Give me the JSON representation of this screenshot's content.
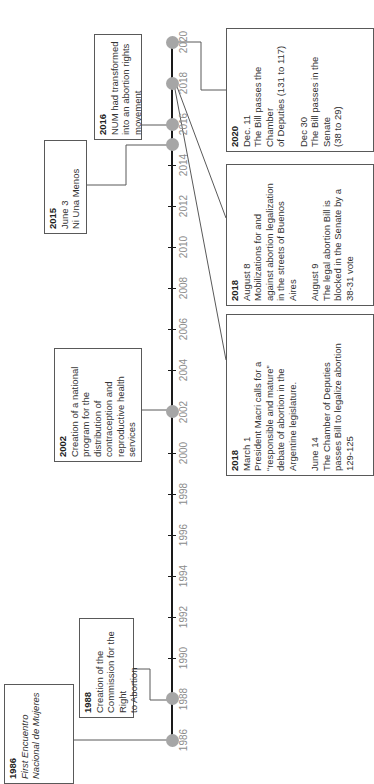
{
  "timeline": {
    "orientation": "rotated-90-ccw",
    "axis_color": "#1a1a1a",
    "dot_color": "#a6a6a6",
    "year_label_color": "#8c8c8c",
    "year_labels": [
      "1986",
      "1988",
      "1990",
      "1992",
      "1994",
      "1996",
      "1998",
      "2000",
      "2002",
      "2004",
      "2006",
      "2008",
      "2010",
      "2012",
      "2014",
      "2016",
      "2018",
      "2020"
    ],
    "markers": [
      "1986",
      "1988",
      "2002",
      "2015",
      "2016",
      "2018",
      "2020"
    ]
  },
  "events": [
    {
      "id": "e1986",
      "year": "1986",
      "lines": [
        {
          "text": "First Encuentro",
          "italic": true
        },
        {
          "text": "Nacional de Mujeres",
          "italic": true
        }
      ]
    },
    {
      "id": "e1988",
      "year": "1988",
      "lines": [
        {
          "text": "Creation of the"
        },
        {
          "text": "Commission for the Right"
        },
        {
          "text": "to Abortion"
        }
      ]
    },
    {
      "id": "e2002",
      "year": "2002",
      "lines": [
        {
          "text": "Creation of a national"
        },
        {
          "text": "program for the"
        },
        {
          "text": "distribution of"
        },
        {
          "text": "contraception and"
        },
        {
          "text": "reproductive health"
        },
        {
          "text": "services"
        }
      ]
    },
    {
      "id": "e2015",
      "year": "2015",
      "lines": [
        {
          "text": "June 3"
        },
        {
          "text": "Ni Una Menos"
        }
      ]
    },
    {
      "id": "e2016",
      "year": "2016",
      "lines": [
        {
          "text": "NUM had transformed"
        },
        {
          "text": "into an abortion rights"
        },
        {
          "text": "movement"
        }
      ]
    },
    {
      "id": "e2018a",
      "year": "2018",
      "lines": [
        {
          "text": "March 1"
        },
        {
          "text": "President Macri calls for a"
        },
        {
          "text": "“responsible and mature”"
        },
        {
          "text": "debate of abortion in the"
        },
        {
          "text": "Argentine legislature."
        },
        {
          "gap": true
        },
        {
          "text": "June 14"
        },
        {
          "text": "The Chamber of Deputies"
        },
        {
          "text": "passes Bill to legalize abortion"
        },
        {
          "text": "129-125"
        }
      ]
    },
    {
      "id": "e2018b",
      "year": "2018",
      "lines": [
        {
          "text": "August 8"
        },
        {
          "text": "Mobilizations for and"
        },
        {
          "text": "against abortion legalization"
        },
        {
          "text": "in the streets of Buenos"
        },
        {
          "text": "Aires"
        },
        {
          "gap": true
        },
        {
          "text": "August 9"
        },
        {
          "text": "The legal abortion Bill is"
        },
        {
          "text": "blocked in the Senate by a"
        },
        {
          "text": "38-31 vote"
        }
      ]
    },
    {
      "id": "e2020",
      "year": "2020",
      "lines": [
        {
          "text": "Dec. 11"
        },
        {
          "text": "The Bill passes the Chamber"
        },
        {
          "text": "of Deputies (131 to 117)"
        },
        {
          "gap": true
        },
        {
          "text": "Dec 30"
        },
        {
          "text": "The Bill passes in the Senate"
        },
        {
          "text": "(38 to 29)"
        }
      ]
    }
  ]
}
